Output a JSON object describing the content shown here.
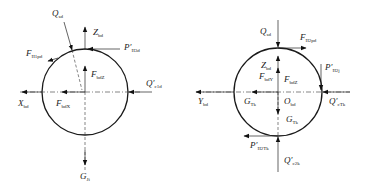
{
  "diagram": {
    "type": "free-body force diagrams (two circular bodies)",
    "left": {
      "labels": {
        "Q_top": {
          "main": "Q",
          "sub": "sd"
        },
        "Z": {
          "main": "Z",
          "sub": "bd"
        },
        "P_top": {
          "main": "P′",
          "sub": "II3d"
        },
        "F_fric": {
          "main": "F",
          "sub": "II1pd"
        },
        "F_z": {
          "main": "F",
          "sub": "bdZ"
        },
        "Q_right": {
          "main": "Q′",
          "sub": "c1d"
        },
        "X": {
          "main": "X",
          "sub": "bd"
        },
        "F_x": {
          "main": "F",
          "sub": "bdX"
        },
        "G": {
          "main": "G",
          "sub": "Ji"
        }
      }
    },
    "right": {
      "labels": {
        "Q_top": {
          "main": "Q",
          "sub": "sd"
        },
        "F_top": {
          "main": "F",
          "sub": "II2pd"
        },
        "Z": {
          "main": "Z",
          "sub": "bd"
        },
        "F_y": {
          "main": "F",
          "sub": "bdY"
        },
        "F_z": {
          "main": "F",
          "sub": "bdZ"
        },
        "P_right": {
          "main": "P′",
          "sub": "II2j"
        },
        "Y": {
          "main": "Y",
          "sub": "bd"
        },
        "G_left": {
          "main": "G",
          "sub": "Tk"
        },
        "O": {
          "main": "O",
          "sub": "bd"
        },
        "Q_right": {
          "main": "Q′",
          "sub": "cTk"
        },
        "G_down": {
          "main": "G",
          "sub": "Tk"
        },
        "P_bottom": {
          "main": "P′",
          "sub": "II2Tk"
        },
        "Q_bottom": {
          "main": "Q′",
          "sub": "c2k"
        }
      }
    }
  }
}
